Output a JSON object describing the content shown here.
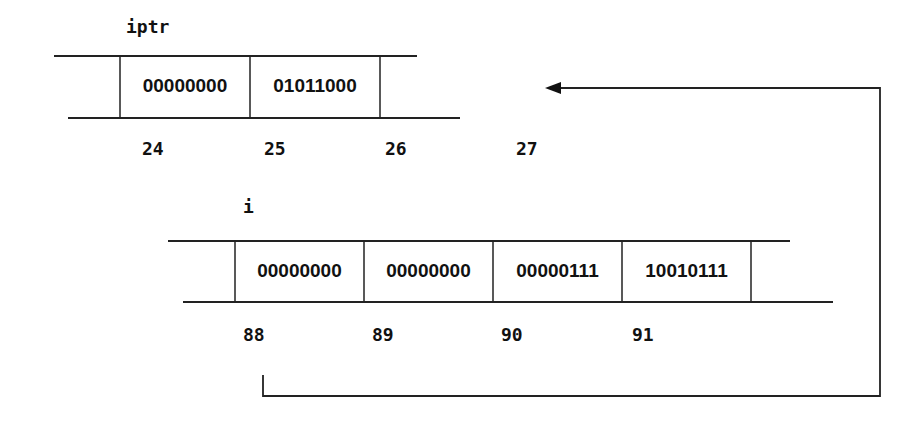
{
  "iptr": {
    "label": "iptr",
    "cells": [
      "00000000",
      "01011000"
    ],
    "addresses": [
      "24",
      "25",
      "26",
      "27"
    ]
  },
  "i": {
    "label": "i",
    "cells": [
      "00000000",
      "00000000",
      "00000111",
      "10010111"
    ],
    "addresses": [
      "88",
      "89",
      "90",
      "91"
    ]
  },
  "arrow": {
    "from": "address 88",
    "to": "iptr"
  }
}
